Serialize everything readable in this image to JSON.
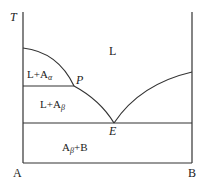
{
  "diagram": {
    "type": "binary phase diagram",
    "axis": {
      "y_label": "T",
      "x_left_label": "A",
      "x_right_label": "B"
    },
    "regions": {
      "liquid": "L",
      "l_a_alpha_main": "L+A",
      "l_a_alpha_sub": "α",
      "l_a_beta_main": "L+A",
      "l_a_beta_sub": "β",
      "solid_main_a": "A",
      "solid_sub": "β",
      "solid_main_b": "+B"
    },
    "points": {
      "peritectic": "P",
      "eutectic": "E"
    },
    "colors": {
      "line": "#333333",
      "text": "#222222",
      "background": "#ffffff"
    }
  }
}
